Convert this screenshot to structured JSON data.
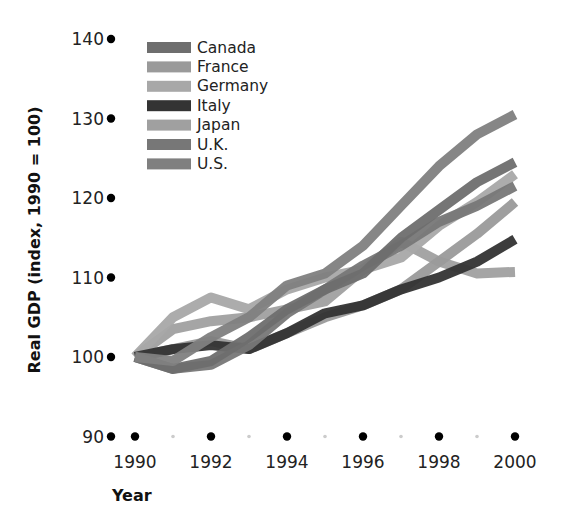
{
  "chart_data": {
    "type": "line",
    "title": "",
    "xlabel": "Year",
    "ylabel": "Real GDP (index, 1990 = 100)",
    "x": [
      1990,
      1991,
      1992,
      1993,
      1994,
      1995,
      1996,
      1997,
      1998,
      1999,
      2000
    ],
    "x_ticks": [
      1990,
      1992,
      1994,
      1996,
      1998,
      2000
    ],
    "y_ticks": [
      90,
      100,
      110,
      120,
      130,
      140
    ],
    "xlim": [
      1990,
      2000
    ],
    "ylim": [
      90,
      140
    ],
    "grid": false,
    "legend_position": "upper-left",
    "series": [
      {
        "name": "Canada",
        "color": "#6e6e6e",
        "values": [
          100,
          98.5,
          99.5,
          102.5,
          106,
          108.5,
          110.5,
          115,
          118.5,
          122,
          124.5
        ]
      },
      {
        "name": "France",
        "color": "#9a9a9a",
        "values": [
          100,
          101,
          102,
          101,
          103,
          105,
          106.5,
          108.5,
          112,
          115.5,
          119.5
        ]
      },
      {
        "name": "Germany",
        "color": "#a8a8a8",
        "values": [
          100,
          105,
          107.5,
          106,
          108.5,
          110,
          111,
          112.5,
          116.5,
          119.5,
          123
        ]
      },
      {
        "name": "Italy",
        "color": "#333333",
        "values": [
          100,
          101,
          101.5,
          101,
          103,
          105.5,
          106.5,
          108.5,
          110,
          112,
          114.8
        ]
      },
      {
        "name": "Japan",
        "color": "#a0a0a0",
        "values": [
          100,
          103.5,
          104.5,
          105,
          106,
          107,
          111,
          114.5,
          112,
          110.5,
          110.7
        ]
      },
      {
        "name": "U.K.",
        "color": "#777777",
        "values": [
          100,
          98.5,
          99,
          101.5,
          105.5,
          108.5,
          111.5,
          114,
          117,
          119,
          121.5
        ]
      },
      {
        "name": "U.S.",
        "color": "#808080",
        "values": [
          100,
          99.5,
          102.5,
          105,
          109,
          110.5,
          114,
          119,
          124,
          128,
          130.5
        ]
      }
    ]
  },
  "legend": {
    "items": [
      "Canada",
      "France",
      "Germany",
      "Italy",
      "Japan",
      "U.K.",
      "U.S."
    ]
  },
  "axes": {
    "x_title": "Year",
    "y_title": "Real GDP (index, 1990 = 100)"
  }
}
